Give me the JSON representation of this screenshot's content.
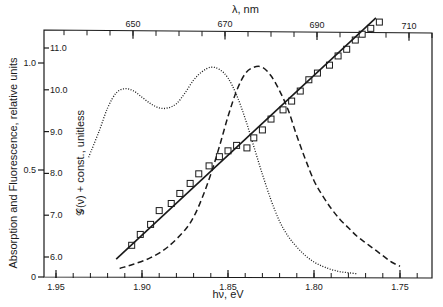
{
  "chart_data": {
    "type": "line",
    "title": "",
    "xlabel": "hν, eV",
    "x2label": "λ, nm",
    "ylabel": "Absorption and Fluorescence, relative units",
    "y2label": "𝒢(ν) + const., unitless",
    "xlim": [
      1.957,
      1.735
    ],
    "ylim": [
      0,
      1.15
    ],
    "y2lim": [
      5.5,
      11.4
    ],
    "grid": false,
    "legend": null,
    "x_ticks": [
      {
        "value": 1.95,
        "label": "1.95"
      },
      {
        "value": 1.9,
        "label": "1.90"
      },
      {
        "value": 1.85,
        "label": "1.85"
      },
      {
        "value": 1.8,
        "label": "1.80"
      },
      {
        "value": 1.75,
        "label": "1.75"
      }
    ],
    "x_minor_tick_step": 0.01,
    "x2_ticks": [
      {
        "value": 650,
        "label": "650"
      },
      {
        "value": 670,
        "label": "670"
      },
      {
        "value": 690,
        "label": "690"
      },
      {
        "value": 710,
        "label": "710"
      }
    ],
    "x2_minor_tick_step": 5,
    "y_ticks": [
      {
        "value": 0,
        "label": "0"
      },
      {
        "value": 0.5,
        "label": "0.5"
      },
      {
        "value": 1.0,
        "label": "1.0"
      }
    ],
    "y2_ticks": [
      {
        "value": 6.0,
        "label": "6.0"
      },
      {
        "value": 7.0,
        "label": "7.0"
      },
      {
        "value": 8.0,
        "label": "8.0"
      },
      {
        "value": 9.0,
        "label": "9.0"
      },
      {
        "value": 10.0,
        "label": "10.0"
      },
      {
        "value": 11.0,
        "label": "11.0"
      }
    ],
    "series": [
      {
        "name": "Absorption",
        "style": "dotted",
        "axis": "left",
        "x": [
          1.931,
          1.925,
          1.92,
          1.915,
          1.91,
          1.905,
          1.9,
          1.895,
          1.89,
          1.885,
          1.88,
          1.875,
          1.87,
          1.865,
          1.86,
          1.855,
          1.85,
          1.845,
          1.84,
          1.835,
          1.83,
          1.825,
          1.82,
          1.815,
          1.81,
          1.805,
          1.8,
          1.795,
          1.79,
          1.785,
          1.78,
          1.775
        ],
        "y": [
          0.56,
          0.68,
          0.79,
          0.86,
          0.88,
          0.87,
          0.84,
          0.81,
          0.79,
          0.79,
          0.81,
          0.86,
          0.92,
          0.96,
          0.98,
          0.97,
          0.93,
          0.85,
          0.74,
          0.61,
          0.48,
          0.36,
          0.26,
          0.19,
          0.14,
          0.1,
          0.07,
          0.05,
          0.035,
          0.025,
          0.02,
          0.015
        ]
      },
      {
        "name": "Fluorescence",
        "style": "dashed",
        "axis": "left",
        "x": [
          1.913,
          1.905,
          1.895,
          1.885,
          1.875,
          1.87,
          1.865,
          1.86,
          1.855,
          1.85,
          1.845,
          1.84,
          1.835,
          1.83,
          1.825,
          1.82,
          1.815,
          1.81,
          1.805,
          1.8,
          1.795,
          1.79,
          1.785,
          1.78,
          1.775,
          1.77,
          1.765,
          1.76,
          1.755,
          1.75
        ],
        "y": [
          0.04,
          0.06,
          0.09,
          0.14,
          0.22,
          0.28,
          0.37,
          0.48,
          0.61,
          0.75,
          0.87,
          0.95,
          0.98,
          0.98,
          0.94,
          0.87,
          0.78,
          0.66,
          0.55,
          0.45,
          0.38,
          0.32,
          0.27,
          0.23,
          0.19,
          0.16,
          0.13,
          0.1,
          0.07,
          0.05
        ]
      },
      {
        "name": "G(v) + const. data",
        "style": "markers-open-square",
        "axis": "right",
        "x": [
          1.906,
          1.901,
          1.895,
          1.89,
          1.883,
          1.878,
          1.872,
          1.867,
          1.861,
          1.855,
          1.85,
          1.845,
          1.839,
          1.835,
          1.83,
          1.825,
          1.818,
          1.813,
          1.808,
          1.803,
          1.798,
          1.791,
          1.786,
          1.781,
          1.776,
          1.772,
          1.767,
          1.762
        ],
        "y": [
          6.28,
          6.54,
          6.78,
          7.11,
          7.28,
          7.52,
          7.76,
          7.99,
          8.18,
          8.4,
          8.54,
          8.67,
          8.61,
          8.85,
          9.04,
          9.3,
          9.52,
          9.73,
          9.97,
          10.24,
          10.4,
          10.59,
          10.81,
          10.97,
          11.19,
          11.33,
          11.47,
          11.62
        ]
      },
      {
        "name": "G(v) + const. linear fit",
        "style": "solid",
        "axis": "right",
        "x": [
          1.915,
          1.764
        ],
        "y": [
          5.95,
          11.72
        ]
      }
    ],
    "annotations": []
  }
}
